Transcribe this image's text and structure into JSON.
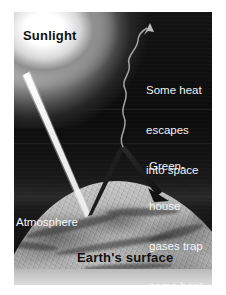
{
  "figure": {
    "kind": "greenhouse-effect-diagram",
    "labels": {
      "sunlight": "Sunlight",
      "escape_line_1": "Some heat",
      "escape_line_2": "escapes",
      "escape_line_3": "into space",
      "greenhouse_line_1": "Green-",
      "greenhouse_line_2": "house",
      "greenhouse_line_3": "gases trap",
      "greenhouse_line_4": "some heat",
      "atmosphere": "Atmosphere",
      "earth_surface": "Earth's surface"
    },
    "colors": {
      "space": "#0c0c0c",
      "sun_glow": "#ffffff",
      "earth_surface": "#a2a2a2",
      "beam": "#f5f5f5",
      "arrow": "#1a1a1a",
      "dark_text": "#111111",
      "light_text": "#f2f2f2",
      "frame_bottom_band": "#cfcfcf"
    },
    "elements": {
      "sunbeam": "incoming-sunlight-ray",
      "reflected_beam": "reflected-heat-arrow",
      "trapped_arrow": "greenhouse-trapped-heat-arrow",
      "wavy_escape": "escaping-heat-wavy-arrow"
    }
  }
}
